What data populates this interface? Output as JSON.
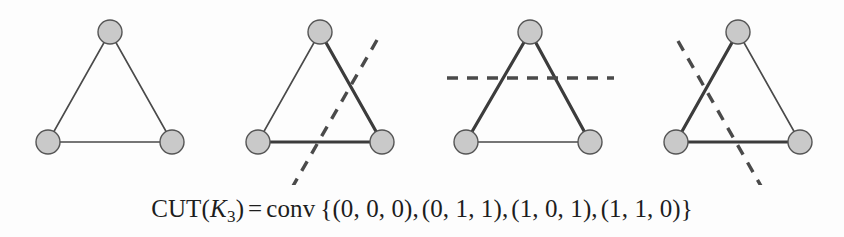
{
  "figure": {
    "caption_formula": {
      "lhs_name": "CUT",
      "lhs_open": "(",
      "lhs_var": "K",
      "lhs_sub": "3",
      "lhs_close": ")",
      "equals": "=",
      "conv": "conv",
      "set_open": "{",
      "set_close": "}",
      "points": [
        "(0, 0, 0)",
        "(0, 1, 1)",
        "(1, 0, 1)",
        "(1, 1, 0)"
      ],
      "separator": ",",
      "plain_text": "CUT(K3) = conv {(0, 0, 0), (0, 1, 1), (1, 0, 1), (1, 1, 0)}"
    },
    "colors": {
      "node_fill": "#c9c9c9",
      "node_stroke": "#555555",
      "edge_thin": "#4a4a4a",
      "edge_cut": "#3c3c3c",
      "hyperplane": "#4a4a4a",
      "background": "#fdfdfd",
      "text": "#1d1d1d"
    },
    "node_radius": 12,
    "edge_thin_width": 1.6,
    "edge_cut_width": 3.2,
    "hyperplane_width": 3.4,
    "hyperplane_dash": "11 9",
    "panels": [
      {
        "id": "panel-1",
        "label": "K3 graph, empty cut",
        "cut_vector": "(0, 0, 0)",
        "nodes": [
          {
            "name": "node-top",
            "x": 110,
            "y": 32
          },
          {
            "name": "node-bottom-left",
            "x": 48,
            "y": 142
          },
          {
            "name": "node-bottom-right",
            "x": 172,
            "y": 142
          }
        ],
        "edges": [
          {
            "name": "edge-left",
            "x1": 110,
            "y1": 32,
            "x2": 48,
            "y2": 142,
            "cut": false
          },
          {
            "name": "edge-right",
            "x1": 110,
            "y1": 32,
            "x2": 172,
            "y2": 142,
            "cut": false
          },
          {
            "name": "edge-bottom",
            "x1": 48,
            "y1": 142,
            "x2": 172,
            "y2": 142,
            "cut": false
          }
        ],
        "hyperplane": null
      },
      {
        "id": "panel-2",
        "label": "K3 graph with cut separating bottom-right vertex",
        "cut_vector": "(0, 1, 1)",
        "nodes": [
          {
            "name": "node-top",
            "x": 320,
            "y": 32
          },
          {
            "name": "node-bottom-left",
            "x": 258,
            "y": 142
          },
          {
            "name": "node-bottom-right",
            "x": 382,
            "y": 142
          }
        ],
        "edges": [
          {
            "name": "edge-left",
            "x1": 320,
            "y1": 32,
            "x2": 258,
            "y2": 142,
            "cut": false
          },
          {
            "name": "edge-right",
            "x1": 320,
            "y1": 32,
            "x2": 382,
            "y2": 142,
            "cut": true
          },
          {
            "name": "edge-bottom",
            "x1": 258,
            "y1": 142,
            "x2": 382,
            "y2": 142,
            "cut": true
          }
        ],
        "hyperplane": {
          "x1": 377,
          "y1": 40,
          "x2": 293,
          "y2": 186
        }
      },
      {
        "id": "panel-3",
        "label": "K3 graph with horizontal cut separating top vertex",
        "cut_vector": "(1, 0, 1)",
        "nodes": [
          {
            "name": "node-top",
            "x": 530,
            "y": 32
          },
          {
            "name": "node-bottom-left",
            "x": 466,
            "y": 142
          },
          {
            "name": "node-bottom-right",
            "x": 590,
            "y": 142
          }
        ],
        "edges": [
          {
            "name": "edge-left",
            "x1": 530,
            "y1": 32,
            "x2": 466,
            "y2": 142,
            "cut": true
          },
          {
            "name": "edge-right",
            "x1": 530,
            "y1": 32,
            "x2": 590,
            "y2": 142,
            "cut": true
          },
          {
            "name": "edge-bottom",
            "x1": 466,
            "y1": 142,
            "x2": 590,
            "y2": 142,
            "cut": false
          }
        ],
        "hyperplane": {
          "x1": 447,
          "y1": 78,
          "x2": 614,
          "y2": 78
        }
      },
      {
        "id": "panel-4",
        "label": "K3 graph with cut separating bottom-left vertex",
        "cut_vector": "(1, 1, 0)",
        "nodes": [
          {
            "name": "node-top",
            "x": 738,
            "y": 32
          },
          {
            "name": "node-bottom-left",
            "x": 676,
            "y": 142
          },
          {
            "name": "node-bottom-right",
            "x": 800,
            "y": 142
          }
        ],
        "edges": [
          {
            "name": "edge-left",
            "x1": 738,
            "y1": 32,
            "x2": 676,
            "y2": 142,
            "cut": true
          },
          {
            "name": "edge-right",
            "x1": 738,
            "y1": 32,
            "x2": 800,
            "y2": 142,
            "cut": false
          },
          {
            "name": "edge-bottom",
            "x1": 676,
            "y1": 142,
            "x2": 800,
            "y2": 142,
            "cut": true
          }
        ],
        "hyperplane": {
          "x1": 678,
          "y1": 41,
          "x2": 761,
          "y2": 186
        }
      }
    ]
  }
}
